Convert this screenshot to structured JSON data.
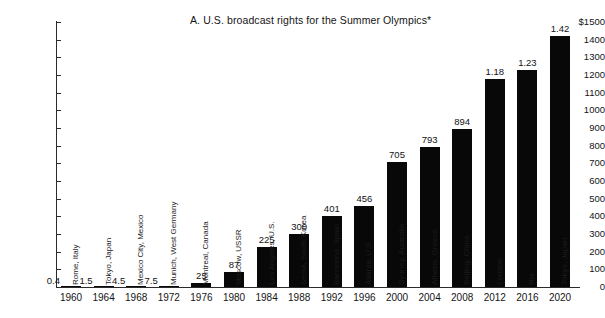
{
  "chart_data": {
    "type": "bar",
    "title": "A.  U.S. broadcast rights for the Summer Olympics*",
    "xlabel": "",
    "ylabel": "",
    "ylim": [
      0,
      1500
    ],
    "ytick_labels": [
      "$1500",
      "1400",
      "1300",
      "1200",
      "1100",
      "1000",
      "900",
      "800",
      "700",
      "600",
      "500",
      "400",
      "300",
      "200",
      "100",
      "0"
    ],
    "ytick_values": [
      1500,
      1400,
      1300,
      1200,
      1100,
      1000,
      900,
      800,
      700,
      600,
      500,
      400,
      300,
      200,
      100,
      0
    ],
    "grid": false,
    "legend": "none",
    "bar_color": "#080808",
    "categories": [
      "1960",
      "1964",
      "1968",
      "1972",
      "1976",
      "1980",
      "1984",
      "1988",
      "1992",
      "1996",
      "2000",
      "2004",
      "2008",
      "2012",
      "2016",
      "2020"
    ],
    "values": [
      0.4,
      1.5,
      4.5,
      7.5,
      25,
      87,
      225,
      300,
      401,
      456,
      705,
      793,
      894,
      1180,
      1230,
      1420
    ],
    "value_labels": [
      "0.4",
      "1.5",
      "4.5",
      "7.5",
      "25",
      "87",
      "225",
      "300",
      "401",
      "456",
      "705",
      "793",
      "894",
      "1.18",
      "1.23",
      "1.42"
    ],
    "point_labels": [
      "Rome, Italy",
      "Tokyo, Japan",
      "Mexico City, Mexico",
      "Munich, West Germany",
      "Montreal, Canada",
      "Moscow, USSR",
      "Los Angeles, U.S.",
      "Seoul, South Korea",
      "Barcelona, Spain",
      "Atlanta, U.S.",
      "Sydney, Australia",
      "Athens, Greece",
      "Beijing, China",
      "London",
      "Rio",
      "Tokyo, Japan"
    ],
    "bars": [
      {
        "year": "1960",
        "city": "Rome, Italy",
        "value": 0.4,
        "label": "0.4",
        "label_inline": true
      },
      {
        "year": "1964",
        "city": "Tokyo, Japan",
        "value": 1.5,
        "label": "1.5",
        "label_inline": true
      },
      {
        "year": "1968",
        "city": "Mexico City, Mexico",
        "value": 4.5,
        "label": "4.5",
        "label_inline": true
      },
      {
        "year": "1972",
        "city": "Munich, West Germany",
        "value": 7.5,
        "label": "7.5",
        "label_inline": true
      },
      {
        "year": "1976",
        "city": "Montreal, Canada",
        "value": 25,
        "label": "25",
        "label_inline": false
      },
      {
        "year": "1980",
        "city": "Moscow, USSR",
        "value": 87,
        "label": "87",
        "label_inline": false
      },
      {
        "year": "1984",
        "city": "Los Angeles, U.S.",
        "value": 225,
        "label": "225",
        "label_inline": false
      },
      {
        "year": "1988",
        "city": "Seoul, South Korea",
        "value": 300,
        "label": "300",
        "label_inline": false
      },
      {
        "year": "1992",
        "city": "Barcelona, Spain",
        "value": 401,
        "label": "401",
        "label_inline": false
      },
      {
        "year": "1996",
        "city": "Atlanta, U.S.",
        "value": 456,
        "label": "456",
        "label_inline": false
      },
      {
        "year": "2000",
        "city": "Sydney, Australia",
        "value": 705,
        "label": "705",
        "label_inline": false
      },
      {
        "year": "2004",
        "city": "Athens, Greece",
        "value": 793,
        "label": "793",
        "label_inline": false
      },
      {
        "year": "2008",
        "city": "Beijing, China",
        "value": 894,
        "label": "894",
        "label_inline": false
      },
      {
        "year": "2012",
        "city": "London",
        "value": 1180,
        "label": "1.18",
        "label_inline": false
      },
      {
        "year": "2016",
        "city": "Rio",
        "value": 1230,
        "label": "1.23",
        "label_inline": false
      },
      {
        "year": "2020",
        "city": "Tokyo, Japan",
        "value": 1420,
        "label": "1.42",
        "label_inline": false
      }
    ]
  }
}
